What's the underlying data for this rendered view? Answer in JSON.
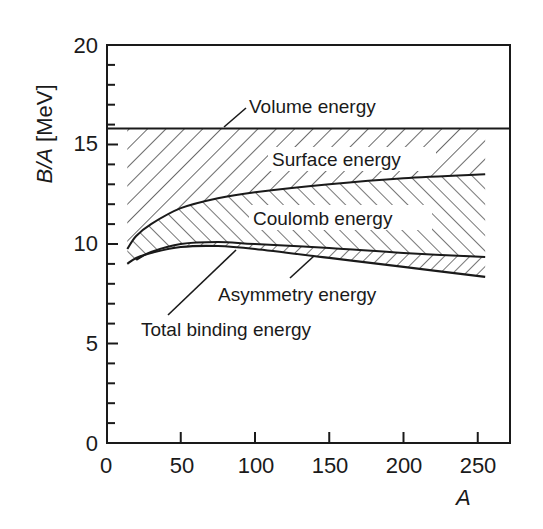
{
  "chart_data": {
    "type": "area",
    "title": "",
    "xlabel": "A",
    "ylabel": "B/A [MeV]",
    "xlim": [
      0,
      272
    ],
    "ylim": [
      0,
      20
    ],
    "x_ticks": [
      0,
      50,
      100,
      150,
      200,
      250
    ],
    "x_tick_labels": [
      "0",
      "50",
      "100",
      "150",
      "200",
      "250"
    ],
    "y_ticks": [
      0,
      5,
      10,
      15,
      20
    ],
    "y_tick_labels": [
      "0",
      "5",
      "10",
      "15",
      "20"
    ],
    "y_minor_step": 1,
    "grid": false,
    "legend": "none (inline annotations)",
    "series": [
      {
        "name": "Volume energy",
        "x": [
          0,
          272
        ],
        "values": [
          15.8,
          15.8
        ]
      },
      {
        "name": "Volume - Surface",
        "x": [
          14,
          20,
          30,
          50,
          75,
          100,
          150,
          200,
          255
        ],
        "values": [
          9.75,
          10.4,
          11.0,
          11.8,
          12.3,
          12.6,
          13.0,
          13.3,
          13.5
        ]
      },
      {
        "name": "Volume - Surface - Coulomb",
        "x": [
          20,
          30,
          50,
          75,
          100,
          150,
          200,
          255
        ],
        "values": [
          9.2,
          9.6,
          10.0,
          10.1,
          10.0,
          9.8,
          9.55,
          9.35
        ]
      },
      {
        "name": "Total binding energy",
        "x": [
          14,
          20,
          30,
          50,
          75,
          100,
          150,
          200,
          255
        ],
        "values": [
          9.0,
          9.3,
          9.55,
          9.85,
          9.9,
          9.75,
          9.3,
          8.85,
          8.35
        ]
      }
    ],
    "regions": [
      {
        "name": "Surface energy",
        "hatch": "backslash",
        "between": [
          "Volume energy",
          "Volume - Surface"
        ]
      },
      {
        "name": "Coulomb energy",
        "hatch": "slash",
        "between": [
          "Volume - Surface",
          "Volume - Surface - Coulomb"
        ]
      },
      {
        "name": "Asymmetry energy",
        "hatch": "backslash",
        "between": [
          "Volume - Surface - Coulomb",
          "Total binding energy"
        ]
      }
    ],
    "annotations": [
      {
        "text": "Volume energy",
        "points_to": "Volume energy line near A=80"
      },
      {
        "text": "Surface energy",
        "region": "Surface energy"
      },
      {
        "text": "Coulomb energy",
        "region": "Coulomb energy"
      },
      {
        "text": "Asymmetry energy",
        "points_to": "Asymmetry band near A=140"
      },
      {
        "text": "Total binding energy",
        "points_to": "Total binding curve near A=87"
      }
    ]
  },
  "labels": {
    "xlabel": "A",
    "ylabel_italic": "B/A",
    "ylabel_unit": " [MeV]",
    "volume": "Volume energy",
    "surface": "Surface energy",
    "coulomb": "Coulomb energy",
    "asymmetry": "Asymmetry energy",
    "total": "Total binding energy",
    "x_ticks": [
      "0",
      "50",
      "100",
      "150",
      "200",
      "250"
    ],
    "y_ticks": [
      "0",
      "5",
      "10",
      "15",
      "20"
    ]
  },
  "colors": {
    "ink": "#1a1a1a",
    "background": "#ffffff"
  }
}
